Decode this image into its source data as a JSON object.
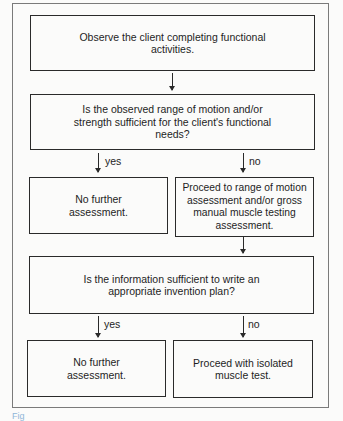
{
  "flowchart": {
    "nodes": {
      "observe": "Observe the client completing functional activities.",
      "q1": "Is the observed range of motion and/or strength sufficient for the client's functional needs?",
      "q1_yes": "No further assessment.",
      "q1_no": "Proceed to range of motion assessment and/or gross manual muscle testing assessment.",
      "q2": "Is the information sufficient to write an appropriate invention plan?",
      "q2_yes": "No further assessment.",
      "q2_no": "Proceed with isolated muscle test."
    },
    "edge_labels": {
      "yes": "yes",
      "no": "no"
    },
    "colors": {
      "line": "#2a2a2a",
      "frame": "#7a7a7a",
      "caption": "#8fb6d8"
    }
  },
  "caption": "Fig"
}
